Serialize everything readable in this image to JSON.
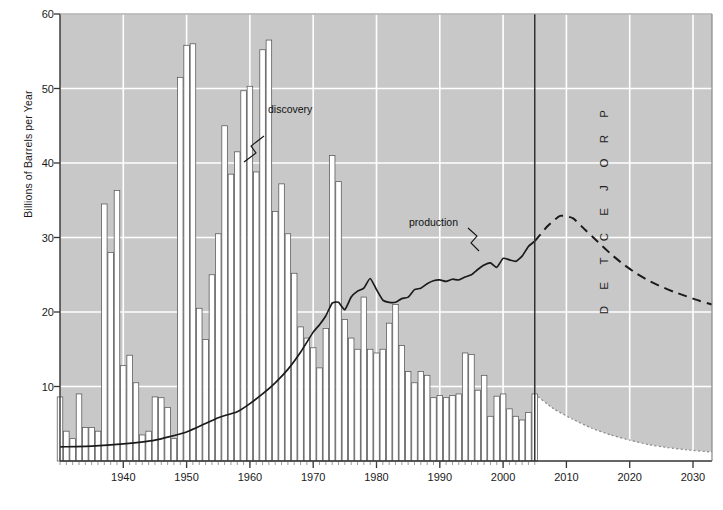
{
  "chart_data": {
    "type": "bar",
    "title": "",
    "subtitle": "",
    "xlabel": "",
    "ylabel": "Billions of Barrels per Year",
    "xlim": [
      1930,
      2033
    ],
    "ylim": [
      0,
      60
    ],
    "grid": true,
    "legend_position": "inline-annotations",
    "yticks": [
      10,
      20,
      30,
      40,
      50,
      60
    ],
    "xticks": [
      1940,
      1950,
      1960,
      1970,
      1980,
      1990,
      2000,
      2010,
      2020,
      2030
    ],
    "annotations": [
      {
        "name": "discovery",
        "text": "discovery",
        "x": 1967,
        "y": 44
      },
      {
        "name": "production",
        "text": "production",
        "x": 1988,
        "y": 32
      },
      {
        "name": "projected",
        "text": "PROJECTED",
        "x": 2016,
        "y": 30,
        "orientation": "vertical"
      }
    ],
    "divider": {
      "name": "projection-divider",
      "x": 2005,
      "label": "history/projection boundary"
    },
    "colors": {
      "plot_background": "#c8c8c8",
      "gridline": "#ffffff",
      "bar_fill": "#ffffff",
      "bar_stroke": "#555555",
      "line": "#1a1a1a",
      "axis": "#333333",
      "projected_fill": "#ffffff"
    },
    "series": [
      {
        "name": "discovery",
        "type": "bar",
        "unit": "Billions of Barrels per Year",
        "categories": [
          1930,
          1931,
          1932,
          1933,
          1934,
          1935,
          1936,
          1937,
          1938,
          1939,
          1940,
          1941,
          1942,
          1943,
          1944,
          1945,
          1946,
          1947,
          1948,
          1949,
          1950,
          1951,
          1952,
          1953,
          1954,
          1955,
          1956,
          1957,
          1958,
          1959,
          1960,
          1961,
          1962,
          1963,
          1964,
          1965,
          1966,
          1967,
          1968,
          1969,
          1970,
          1971,
          1972,
          1973,
          1974,
          1975,
          1976,
          1977,
          1978,
          1979,
          1980,
          1981,
          1982,
          1983,
          1984,
          1985,
          1986,
          1987,
          1988,
          1989,
          1990,
          1991,
          1992,
          1993,
          1994,
          1995,
          1996,
          1997,
          1998,
          1999,
          2000,
          2001,
          2002,
          2003,
          2004,
          2005
        ],
        "values": [
          8.6,
          4.0,
          3.0,
          9.0,
          4.5,
          4.5,
          4.0,
          34.5,
          28.0,
          36.3,
          12.8,
          14.2,
          10.5,
          3.5,
          4.0,
          8.6,
          8.5,
          7.2,
          3.0,
          51.5,
          55.8,
          56.0,
          20.5,
          16.3,
          25.0,
          30.5,
          45.0,
          38.5,
          41.5,
          49.7,
          50.3,
          38.8,
          55.2,
          56.5,
          33.5,
          37.2,
          30.5,
          25.2,
          18.0,
          16.5,
          15.2,
          12.5,
          17.8,
          41.0,
          37.5,
          19.0,
          16.5,
          15.0,
          22.0,
          15.0,
          14.5,
          15.0,
          18.5,
          21.0,
          15.5,
          12.0,
          10.5,
          12.0,
          11.5,
          8.5,
          8.8,
          8.5,
          8.8,
          9.0,
          14.5,
          14.3,
          9.5,
          11.5,
          6.0,
          8.7,
          9.0,
          7.0,
          6.0,
          5.5,
          6.5,
          9.0
        ]
      },
      {
        "name": "production",
        "type": "line",
        "unit": "Billions of Barrels per Year",
        "categories": [
          1930,
          1935,
          1940,
          1945,
          1950,
          1955,
          1958,
          1960,
          1962,
          1964,
          1966,
          1968,
          1970,
          1971,
          1972,
          1973,
          1974,
          1975,
          1976,
          1977,
          1978,
          1979,
          1980,
          1981,
          1982,
          1983,
          1984,
          1985,
          1986,
          1987,
          1988,
          1989,
          1990,
          1991,
          1992,
          1993,
          1994,
          1995,
          1996,
          1997,
          1998,
          1999,
          2000,
          2001,
          2002,
          2003,
          2004,
          2005
        ],
        "values": [
          1.9,
          2.0,
          2.3,
          2.8,
          3.9,
          5.8,
          6.6,
          7.7,
          9.0,
          10.5,
          12.3,
          14.6,
          17.3,
          18.3,
          19.5,
          21.2,
          21.3,
          20.3,
          22.0,
          22.8,
          23.2,
          24.5,
          23.0,
          21.6,
          21.3,
          21.3,
          21.8,
          22.0,
          23.0,
          23.2,
          23.8,
          24.2,
          24.3,
          24.1,
          24.4,
          24.3,
          24.7,
          25.0,
          25.7,
          26.3,
          26.6,
          26.0,
          27.2,
          27.0,
          26.8,
          27.5,
          28.8,
          29.5
        ]
      },
      {
        "name": "projected-production",
        "type": "dashed-line",
        "unit": "Billions of Barrels per Year",
        "categories": [
          2005,
          2007,
          2009,
          2011,
          2013,
          2015,
          2017,
          2019,
          2021,
          2023,
          2025,
          2027,
          2029,
          2031,
          2033
        ],
        "values": [
          29.5,
          31.5,
          32.9,
          32.6,
          31.0,
          29.4,
          27.8,
          26.4,
          25.2,
          24.2,
          23.4,
          22.7,
          22.1,
          21.5,
          21.0
        ]
      },
      {
        "name": "projected-discovery",
        "type": "area-dotted",
        "unit": "Billions of Barrels per Year",
        "categories": [
          2005,
          2008,
          2011,
          2014,
          2017,
          2020,
          2023,
          2026,
          2029,
          2033
        ],
        "values": [
          9.0,
          7.0,
          5.6,
          4.4,
          3.5,
          2.8,
          2.2,
          1.8,
          1.5,
          1.2
        ]
      }
    ]
  }
}
